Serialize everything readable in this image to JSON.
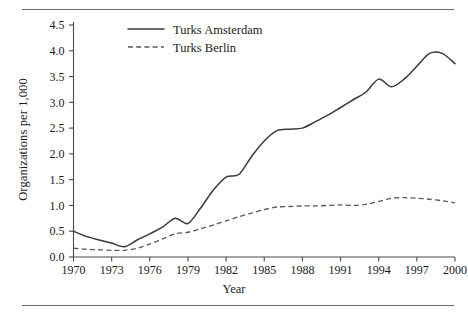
{
  "chart_data": {
    "type": "line",
    "title": "",
    "xlabel": "Year",
    "ylabel": "Organizations per 1,000",
    "xlim": [
      1970,
      2000
    ],
    "ylim": [
      0.0,
      4.5
    ],
    "grid": false,
    "legend_position": "top-center",
    "xticks": [
      1970,
      1973,
      1976,
      1979,
      1982,
      1985,
      1988,
      1991,
      1994,
      1997,
      2000
    ],
    "xtick_labels": [
      "1970",
      "1973",
      "1976",
      "1979",
      "1982",
      "1985",
      "1988",
      "1991",
      "1994",
      "1997",
      "2000"
    ],
    "yticks": [
      0.0,
      0.5,
      1.0,
      1.5,
      2.0,
      2.5,
      3.0,
      3.5,
      4.0,
      4.5
    ],
    "ytick_labels": [
      "0.0",
      "0.5",
      "1.0",
      "1.5",
      "2.0",
      "2.5",
      "3.0",
      "3.5",
      "4.0",
      "4.5"
    ],
    "x": [
      1970,
      1971,
      1972,
      1973,
      1974,
      1975,
      1976,
      1977,
      1978,
      1979,
      1980,
      1981,
      1982,
      1983,
      1984,
      1985,
      1986,
      1987,
      1988,
      1989,
      1990,
      1991,
      1992,
      1993,
      1994,
      1995,
      1996,
      1997,
      1998,
      1999,
      2000
    ],
    "series": [
      {
        "name": "Turks Amsterdam",
        "style": "solid",
        "color": "#3a3a3a",
        "values": [
          0.5,
          0.4,
          0.33,
          0.27,
          0.2,
          0.33,
          0.45,
          0.58,
          0.75,
          0.65,
          0.95,
          1.3,
          1.55,
          1.6,
          1.95,
          2.25,
          2.45,
          2.48,
          2.5,
          2.62,
          2.75,
          2.9,
          3.05,
          3.2,
          3.45,
          3.3,
          3.45,
          3.7,
          3.95,
          3.95,
          3.75
        ]
      },
      {
        "name": "Turks Berlin",
        "style": "dashed",
        "color": "#5a5a5a",
        "values": [
          0.17,
          0.15,
          0.14,
          0.13,
          0.13,
          0.17,
          0.25,
          0.35,
          0.45,
          0.48,
          0.55,
          0.62,
          0.7,
          0.78,
          0.85,
          0.92,
          0.97,
          0.98,
          0.99,
          0.99,
          1.0,
          1.01,
          1.0,
          1.02,
          1.08,
          1.14,
          1.15,
          1.14,
          1.12,
          1.09,
          1.05
        ]
      }
    ],
    "legend": [
      {
        "label": "Turks Amsterdam",
        "style": "solid"
      },
      {
        "label": "Turks Berlin",
        "style": "dashed"
      }
    ]
  }
}
